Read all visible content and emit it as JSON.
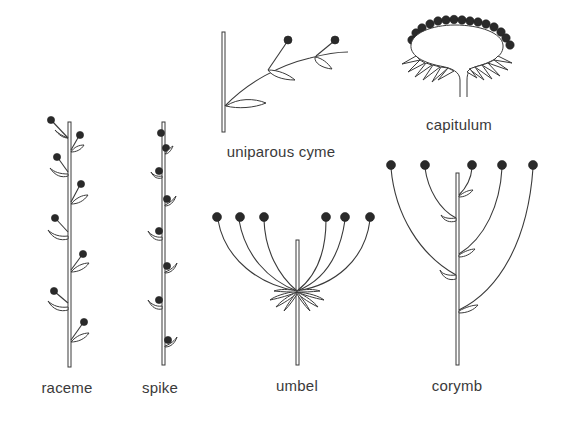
{
  "figure": {
    "colors": {
      "ink": "#2a2a2a",
      "background": "#ffffff",
      "label": "#3a3a3a"
    }
  },
  "labels": {
    "uniparous_cyme": "uniparous  cyme",
    "capitulum": "capitulum",
    "raceme": "raceme",
    "spike": "spike",
    "umbel": "umbel",
    "corymb": "corymb"
  },
  "diagrams": [
    {
      "id": "uniparous_cyme",
      "flowers": 2,
      "bracts": 3
    },
    {
      "id": "capitulum",
      "flowers": 15,
      "bracts": 12
    },
    {
      "id": "raceme",
      "flowers": 8,
      "bracts": 8
    },
    {
      "id": "spike",
      "flowers": 8,
      "bracts": 8
    },
    {
      "id": "umbel",
      "flowers": 6,
      "bracts": 8
    },
    {
      "id": "corymb",
      "flowers": 5,
      "bracts": 5
    }
  ]
}
